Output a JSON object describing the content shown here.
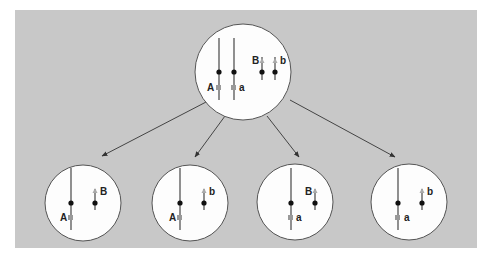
{
  "diagram": {
    "type": "chromosome-segregation",
    "background_color": "#c8c8c8",
    "parent_cell": {
      "labels": {
        "long_left": "A",
        "long_right": "a",
        "short_left": "B",
        "short_right": "b"
      }
    },
    "daughter_cells": [
      {
        "long_label": "A",
        "short_label": "B"
      },
      {
        "long_label": "A",
        "short_label": "b"
      },
      {
        "long_label": "a",
        "short_label": "B"
      },
      {
        "long_label": "a",
        "short_label": "b"
      }
    ]
  }
}
